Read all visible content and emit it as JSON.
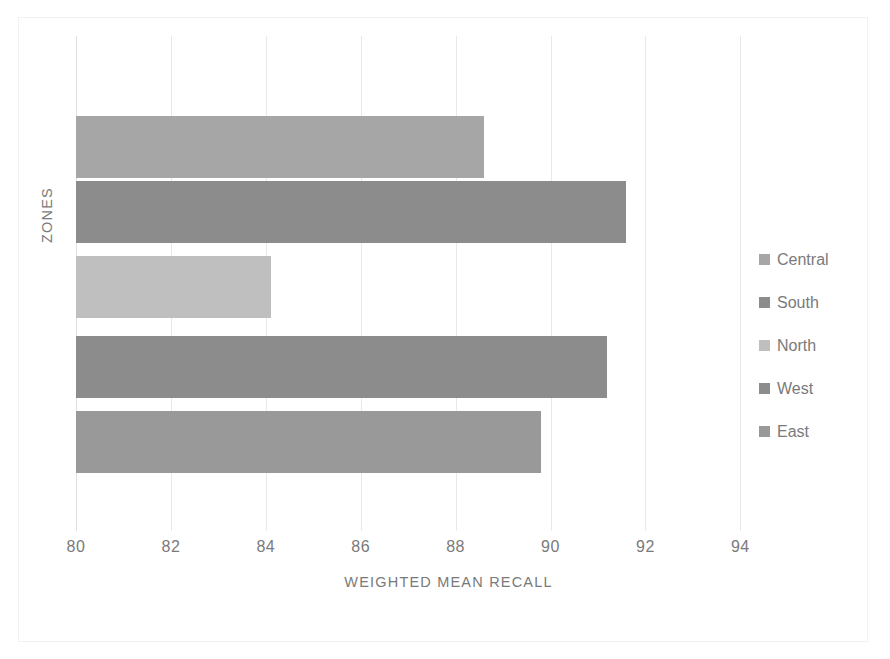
{
  "chart_data": {
    "type": "bar",
    "orientation": "horizontal",
    "title": "",
    "xlabel": "WEIGHTED MEAN RECALL",
    "ylabel": "ZONES",
    "categories": [
      "East",
      "West",
      "North",
      "South",
      "Central"
    ],
    "values": [
      89.8,
      91.2,
      84.1,
      91.6,
      88.6
    ],
    "series": [
      {
        "name": "Central",
        "value": 88.6,
        "color": "#a6a6a6"
      },
      {
        "name": "South",
        "value": 91.6,
        "color": "#8c8c8c"
      },
      {
        "name": "North",
        "value": 84.1,
        "color": "#bfbfbf"
      },
      {
        "name": "West",
        "value": 91.2,
        "color": "#8c8c8c"
      },
      {
        "name": "East",
        "value": 89.8,
        "color": "#999999"
      }
    ],
    "xlim": [
      80,
      95.7
    ],
    "xticks": [
      80,
      82,
      84,
      86,
      88,
      90,
      92,
      94
    ],
    "xtick_labels": [
      "80",
      "82",
      "84",
      "86",
      "88",
      "90",
      "92",
      "94"
    ],
    "grid": "vertical",
    "legend_position": "right",
    "legend_entries": [
      "Central",
      "South",
      "North",
      "West",
      "East"
    ]
  },
  "axes": {
    "x_title": "WEIGHTED MEAN RECALL",
    "y_title": "ZONES"
  },
  "legend": {
    "items": [
      {
        "label": "Central",
        "color": "#a6a6a6"
      },
      {
        "label": "South",
        "color": "#8c8c8c"
      },
      {
        "label": "North",
        "color": "#bfbfbf"
      },
      {
        "label": "West",
        "color": "#8c8c8c"
      },
      {
        "label": "East",
        "color": "#999999"
      }
    ]
  },
  "colors": {
    "background": "#ffffff",
    "gridline": "#e8e8e8",
    "text": "#7a7a7a",
    "border": "#f2f2f2"
  }
}
